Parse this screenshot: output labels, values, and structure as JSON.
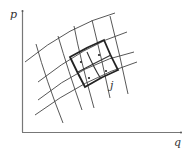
{
  "axes": {
    "y_label": "p",
    "x_label": "q"
  },
  "annotations": {
    "cell_label": "j"
  },
  "colors": {
    "line": "#444444",
    "bold": "#222222",
    "axis": "#666666"
  }
}
